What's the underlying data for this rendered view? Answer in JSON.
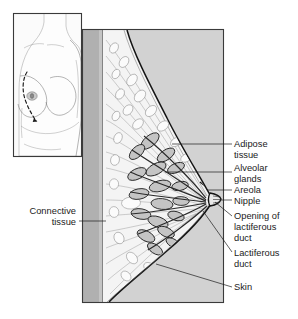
{
  "figure": {
    "background_color": "#ffffff"
  },
  "inset": {
    "name": "torso-inset",
    "description": "Anterior view of female torso with dashed sagittal section plane through the breast",
    "section_line_style": "dashed"
  },
  "main_panel": {
    "name": "sagittal-section-panel",
    "description": "Sagittal cross-section of the breast showing internal structures"
  },
  "colors": {
    "background": "#ffffff",
    "panel_fill": "#d2d2d2",
    "chest_wall": "#b4b4b4",
    "tissue_light": "#f2f2f2",
    "gland_fill": "#c9c9c9",
    "outline": "#1d1d1d",
    "text": "#1b1b1b"
  },
  "labels": {
    "left": [
      {
        "id": "connective-tissue",
        "lines": [
          "Connective",
          "tissue"
        ],
        "align": "right"
      }
    ],
    "right": [
      {
        "id": "adipose-tissue",
        "lines": [
          "Adipose",
          "tissue"
        ]
      },
      {
        "id": "alveolar-glands",
        "lines": [
          "Alveolar",
          "glands"
        ]
      },
      {
        "id": "areola",
        "lines": [
          "Areola"
        ]
      },
      {
        "id": "nipple",
        "lines": [
          "Nipple"
        ]
      },
      {
        "id": "opening-of-lactiferous-duct",
        "lines": [
          "Opening of",
          "lactiferous",
          "duct"
        ]
      },
      {
        "id": "lactiferous-duct",
        "lines": [
          "Lactiferous",
          "duct"
        ]
      },
      {
        "id": "skin",
        "lines": [
          "Skin"
        ]
      }
    ]
  }
}
